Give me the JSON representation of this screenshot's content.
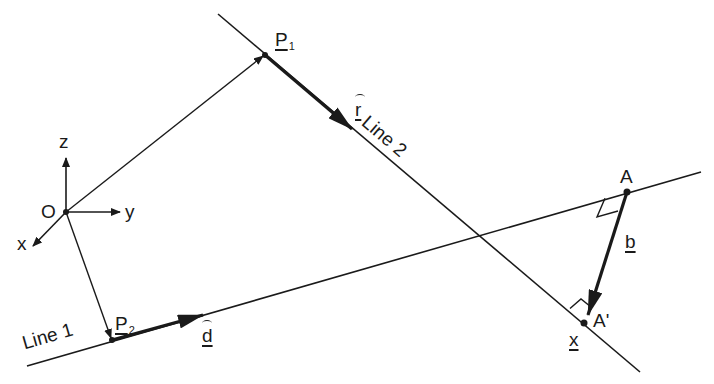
{
  "diagram": {
    "type": "vector-geometry",
    "colors": {
      "ink": "#1a1a1a",
      "background": "#ffffff"
    },
    "axes": {
      "origin_label": "O",
      "x_label": "x",
      "y_label": "y",
      "z_label": "z"
    },
    "line1": {
      "label": "Line 1",
      "point_label": "P",
      "point_subscript": "2",
      "direction_label": "d"
    },
    "line2": {
      "label": "Line 2",
      "point_label": "P",
      "point_subscript": "1",
      "direction_label": "r"
    },
    "point_a": {
      "label": "A"
    },
    "point_a_prime": {
      "label": "A'"
    },
    "vector_b": {
      "label": "b"
    },
    "vector_x": {
      "label": "x"
    }
  }
}
